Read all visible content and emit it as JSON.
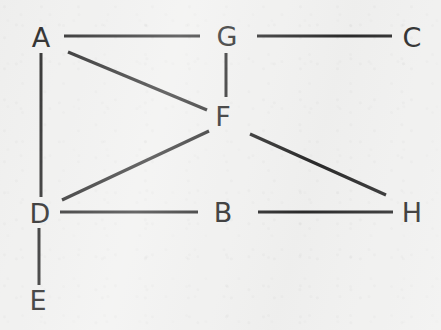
{
  "figure": {
    "kind": "undirected-graph-diagram",
    "background_color": "#f1f1f0",
    "stroke_color": "#2b2b2b",
    "label_color": "#262626",
    "width": 441,
    "height": 330
  },
  "nodes": [
    {
      "id": "A",
      "label": "A",
      "x": 41,
      "y": 37
    },
    {
      "id": "G",
      "label": "G",
      "x": 227,
      "y": 36
    },
    {
      "id": "C",
      "label": "C",
      "x": 412,
      "y": 37
    },
    {
      "id": "F",
      "label": "F",
      "x": 223,
      "y": 116
    },
    {
      "id": "D",
      "label": "D",
      "x": 40,
      "y": 213
    },
    {
      "id": "B",
      "label": "B",
      "x": 223,
      "y": 212
    },
    {
      "id": "H",
      "label": "H",
      "x": 412,
      "y": 212
    },
    {
      "id": "E",
      "label": "E",
      "x": 38,
      "y": 300
    }
  ],
  "edges": [
    {
      "id": "edge-a-g",
      "from": "A",
      "to": "G",
      "x1": 64,
      "y1": 36,
      "x2": 200,
      "y2": 36,
      "width": 3.0
    },
    {
      "id": "edge-g-c",
      "from": "G",
      "to": "C",
      "x1": 257,
      "y1": 36,
      "x2": 392,
      "y2": 36,
      "width": 3.0
    },
    {
      "id": "edge-g-f",
      "from": "G",
      "to": "F",
      "x1": 226,
      "y1": 53,
      "x2": 226,
      "y2": 97,
      "width": 3.0
    },
    {
      "id": "edge-a-f",
      "from": "A",
      "to": "F",
      "x1": 68,
      "y1": 52,
      "x2": 207,
      "y2": 110,
      "width": 3.2
    },
    {
      "id": "edge-a-d",
      "from": "A",
      "to": "D",
      "x1": 41,
      "y1": 53,
      "x2": 41,
      "y2": 197,
      "width": 3.0
    },
    {
      "id": "edge-d-f",
      "from": "D",
      "to": "F",
      "x1": 62,
      "y1": 200,
      "x2": 209,
      "y2": 131,
      "width": 3.2
    },
    {
      "id": "edge-f-h",
      "from": "F",
      "to": "H",
      "x1": 250,
      "y1": 134,
      "x2": 386,
      "y2": 195,
      "width": 3.2
    },
    {
      "id": "edge-d-b",
      "from": "D",
      "to": "B",
      "x1": 60,
      "y1": 212,
      "x2": 198,
      "y2": 212,
      "width": 3.0
    },
    {
      "id": "edge-b-h",
      "from": "B",
      "to": "H",
      "x1": 258,
      "y1": 212,
      "x2": 393,
      "y2": 212,
      "width": 3.0
    },
    {
      "id": "edge-d-e",
      "from": "D",
      "to": "E",
      "x1": 39,
      "y1": 228,
      "x2": 39,
      "y2": 285,
      "width": 3.0
    }
  ]
}
